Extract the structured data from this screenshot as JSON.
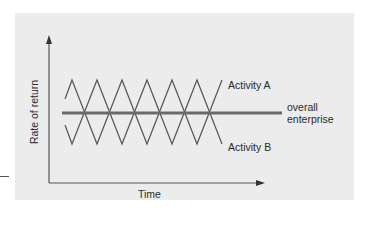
{
  "figure": {
    "y_axis_label": "Rate of return",
    "x_axis_label": "Time",
    "series": {
      "activity_a": {
        "label": "Activity A",
        "shape": "zigzag",
        "phase": "starts rising to peak"
      },
      "activity_b": {
        "label": "Activity B",
        "shape": "zigzag",
        "phase": "inverse of Activity A"
      },
      "overall": {
        "label_line1": "overall",
        "label_line2": "enterprise",
        "shape": "flat bold line"
      }
    },
    "colors": {
      "background": "#ffffff",
      "panel": "#ececec",
      "lines": "#555555",
      "overall_line": "#666666",
      "text": "#2a2a2a"
    }
  }
}
